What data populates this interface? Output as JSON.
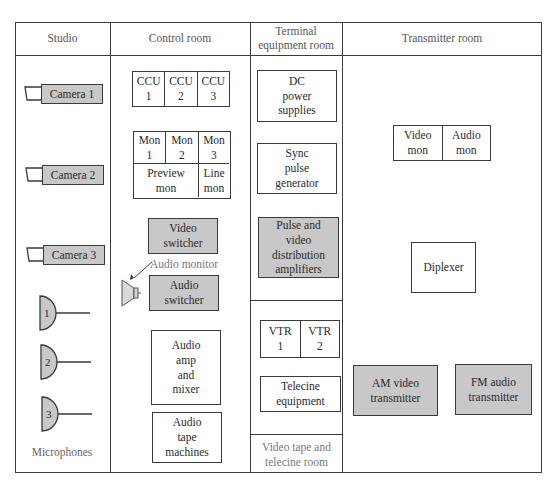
{
  "headers": {
    "studio": "Studio",
    "control_room": "Control room",
    "terminal_room": "Terminal\nequipment room",
    "transmitter_room": "Transmitter room"
  },
  "studio": {
    "cameras": [
      "Camera 1",
      "Camera 2",
      "Camera 3"
    ],
    "microphones": [
      "1",
      "2",
      "3"
    ],
    "microphones_label": "Microphones"
  },
  "control_room": {
    "ccu": [
      "CCU\n1",
      "CCU\n2",
      "CCU\n3"
    ],
    "monitors": [
      "Mon\n1",
      "Mon\n2",
      "Mon\n3"
    ],
    "preview_mon": "Preview\nmon",
    "line_mon": "Line\nmon",
    "video_switcher": "Video\nswitcher",
    "audio_monitor_label": "Audio monitor",
    "audio_switcher": "Audio\nswitcher",
    "audio_amp_mixer": "Audio\namp\nand\nmixer",
    "audio_tape": "Audio\ntape\nmachines"
  },
  "terminal_room": {
    "dc_power": "DC\npower\nsupplies",
    "sync_pulse": "Sync\npulse\ngenerator",
    "pulse_video_da": "Pulse and\nvideo\ndistribution\namplifiers"
  },
  "vtr_room": {
    "vtr": [
      "VTR\n1",
      "VTR\n2"
    ],
    "telecine": "Telecine\nequipment",
    "label": "Video tape and\ntelecine room"
  },
  "transmitter_room": {
    "video_mon": "Video\nmon",
    "audio_mon": "Audio\nmon",
    "diplexer": "Diplexer",
    "am_video": "AM video\ntransmitter",
    "fm_audio": "FM audio\ntransmitter"
  },
  "colors": {
    "equipment_fill": "#c8c8c8",
    "line": "#3a3a3a"
  }
}
